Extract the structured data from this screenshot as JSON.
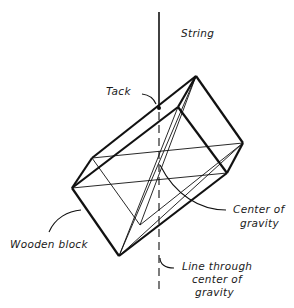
{
  "diagram": {
    "labels": {
      "string": "String",
      "tack": "Tack",
      "center_of_gravity_line1": "Center of",
      "center_of_gravity_line2": "gravity",
      "wooden_block": "Wooden block",
      "line_through_line1": "Line through",
      "line_through_line2": "center of",
      "line_through_line3": "gravity"
    },
    "colors": {
      "ink": "#111111",
      "background": "#ffffff"
    }
  }
}
